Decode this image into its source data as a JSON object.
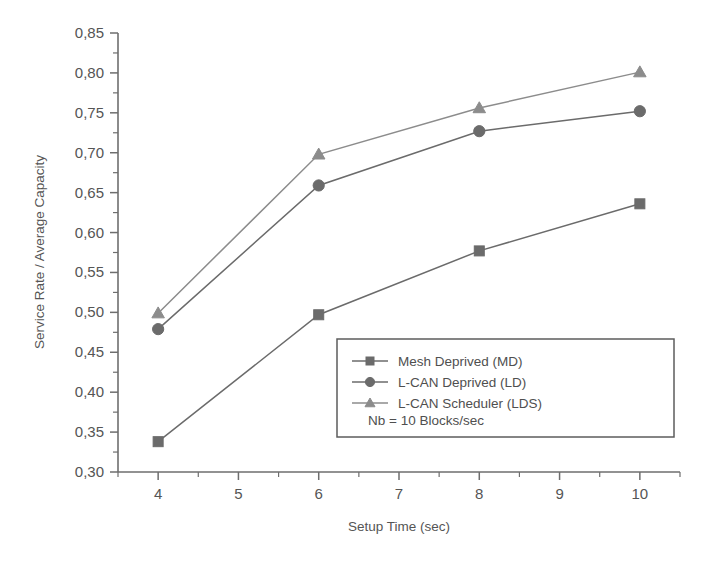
{
  "chart_data": {
    "type": "line",
    "title": "",
    "xlabel": "Setup Time (sec)",
    "ylabel": "Service Rate / Average Capacity",
    "x": [
      4,
      6,
      8,
      10
    ],
    "xlim": [
      3.5,
      10.5
    ],
    "ylim": [
      0.3,
      0.85
    ],
    "xticks": [
      4,
      5,
      6,
      7,
      8,
      9,
      10
    ],
    "xtick_labels": [
      "4",
      "5",
      "6",
      "7",
      "8",
      "9",
      "10"
    ],
    "yticks": [
      0.3,
      0.35,
      0.4,
      0.45,
      0.5,
      0.55,
      0.6,
      0.65,
      0.7,
      0.75,
      0.8,
      0.85
    ],
    "ytick_labels": [
      "0,30",
      "0,35",
      "0,40",
      "0,45",
      "0,50",
      "0,55",
      "0,60",
      "0,65",
      "0,70",
      "0,75",
      "0,80",
      "0,85"
    ],
    "x_minor_step": 0.5,
    "y_minor_step": 0.025,
    "grid": false,
    "legend_position": "lower-right-inside",
    "series": [
      {
        "name": "Mesh Deprived (MD)",
        "marker": "square",
        "color": "#6b6b6b",
        "values": [
          0.338,
          0.497,
          0.577,
          0.636
        ]
      },
      {
        "name": "L-CAN Deprived (LD)",
        "marker": "circle",
        "color": "#6b6b6b",
        "values": [
          0.479,
          0.659,
          0.727,
          0.752
        ]
      },
      {
        "name": "L-CAN Scheduler (LDS)",
        "marker": "triangle",
        "color": "#8c8c8c",
        "values": [
          0.499,
          0.698,
          0.756,
          0.801
        ]
      }
    ],
    "annotations": [
      {
        "text": "Nb = 10 Blocks/sec"
      }
    ]
  },
  "legend": {
    "entries": [
      {
        "label": "Mesh Deprived (MD)"
      },
      {
        "label": "L-CAN Deprived (LD)"
      },
      {
        "label": "L-CAN Scheduler (LDS)"
      }
    ],
    "note": "Nb = 10 Blocks/sec"
  },
  "axes": {
    "x_title": "Setup Time (sec)",
    "y_title": "Service Rate / Average Capacity"
  }
}
